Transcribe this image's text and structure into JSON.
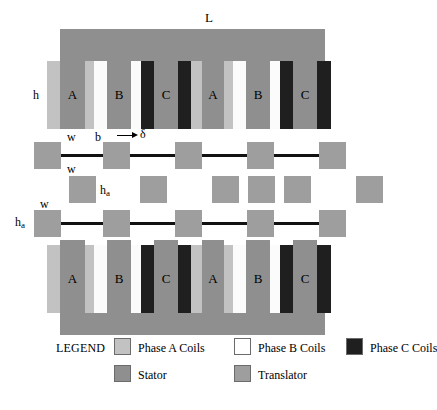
{
  "figure": {
    "dimension_labels": {
      "length": "L",
      "stator_height": "h",
      "tooth_width": "w",
      "slot_width": "b",
      "airgap": "δ",
      "translator_height": "h",
      "translator_height_sub": "a",
      "translator_width": "w"
    }
  },
  "stator_top": {
    "slot_letters": [
      "A",
      "B",
      "C",
      "A",
      "B",
      "C"
    ]
  },
  "stator_bottom": {
    "slot_letters": [
      "A",
      "B",
      "C",
      "A",
      "B",
      "C"
    ]
  },
  "legend": {
    "title": "LEGEND",
    "row1": [
      {
        "label": "Phase A Coils",
        "swatch": "#c2c2c2",
        "name": "phase-a-coils"
      },
      {
        "label": "Phase B Coils",
        "swatch": "#ffffff",
        "name": "phase-b-coils"
      },
      {
        "label": "Phase C Coils",
        "swatch": "#1f1f1f",
        "name": "phase-c-coils"
      }
    ],
    "row2": [
      {
        "label": "Stator",
        "swatch": "#8f8f8f",
        "name": "stator"
      },
      {
        "label": "Translator",
        "swatch": "#9e9e9e",
        "name": "translator"
      }
    ]
  },
  "colors": {
    "stator": "#8f8f8f",
    "translator": "#9e9e9e",
    "phase_a": "#c2c2c2",
    "phase_b": "#fbfbfb",
    "phase_c": "#1f1f1f",
    "bar": "#111111",
    "background": "#ffffff"
  }
}
